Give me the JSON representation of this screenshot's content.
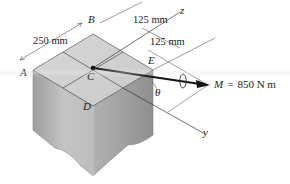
{
  "figure": {
    "type": "isometric block with couple moment",
    "points": {
      "A": "A",
      "B": "B",
      "C": "C",
      "D": "D",
      "E": "E"
    },
    "axes": {
      "z": "z",
      "y": "y"
    },
    "angle": "θ",
    "dimensions": {
      "left": "250 mm",
      "top_right_1": "125 mm",
      "top_right_2": "125 mm"
    },
    "moment": {
      "symbol": "M",
      "equals": "=",
      "value": "850 N m",
      "label": "M = 850 N m"
    },
    "colors": {
      "top_face": "#cfcfcf",
      "left_face": "#b9b9b9",
      "right_face": "#a6a6a6",
      "lines": "#333333",
      "vector": "#111111"
    }
  }
}
